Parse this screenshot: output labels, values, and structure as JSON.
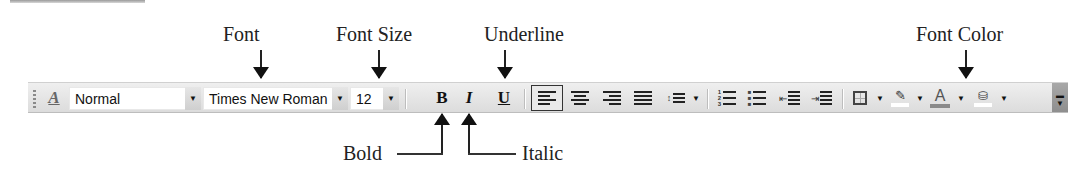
{
  "annotations": {
    "font": "Font",
    "font_size": "Font Size",
    "underline": "Underline",
    "font_color": "Font Color",
    "bold": "Bold",
    "italic": "Italic"
  },
  "toolbar": {
    "style_value": "Normal",
    "font_value": "Times New Roman",
    "size_value": "12",
    "bold_label": "B",
    "italic_label": "I",
    "underline_label": "U",
    "dropdown_glyph": "▼",
    "font_color_glyph": "A",
    "align_selected": "left",
    "colors": {
      "font_color_bar": "#8a8a8a",
      "highlight_bar": "#ffffff",
      "fill_bar": "#ffffff"
    }
  }
}
